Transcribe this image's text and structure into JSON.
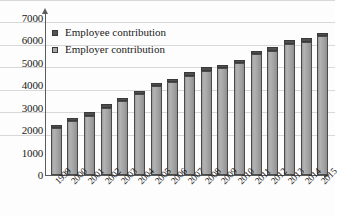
{
  "chart_data": {
    "type": "bar",
    "title": "",
    "xlabel": "",
    "ylabel": "",
    "ylim": [
      0,
      7000
    ],
    "yticks": [
      0,
      1000,
      2000,
      3000,
      4000,
      5000,
      6000,
      7000
    ],
    "ytick_labels": [
      "0",
      "1000",
      "2000",
      "3000",
      "4000",
      "5000",
      "6000",
      "7000"
    ],
    "grid": true,
    "stacked": true,
    "legend_position": "top-left",
    "categories": [
      "1999",
      "2000",
      "2001",
      "2002",
      "2003",
      "2004",
      "2005",
      "2006",
      "2007",
      "2008",
      "2009",
      "2010",
      "2011",
      "2012",
      "2013",
      "2014",
      "2015"
    ],
    "series": [
      {
        "name": "Employer contribution",
        "color": "#a8a8a8",
        "values": [
          2100,
          2400,
          2650,
          3000,
          3300,
          3600,
          3950,
          4150,
          4400,
          4650,
          4750,
          5000,
          5400,
          5550,
          5850,
          5950,
          6200
        ]
      },
      {
        "name": "Employee contribution",
        "color": "#555555",
        "values": [
          150,
          150,
          150,
          150,
          150,
          150,
          150,
          150,
          200,
          150,
          150,
          150,
          150,
          150,
          150,
          150,
          150
        ]
      }
    ],
    "totals": [
      2250,
      2550,
      2800,
      3150,
      3450,
      3750,
      4100,
      4300,
      4600,
      4800,
      4900,
      5150,
      5550,
      5700,
      6000,
      6100,
      6350
    ]
  },
  "legend": {
    "items": [
      {
        "label": "Employee contribution",
        "swatch_class": "sw-employee"
      },
      {
        "label": "Employer contribution",
        "swatch_class": "sw-employer"
      }
    ]
  }
}
